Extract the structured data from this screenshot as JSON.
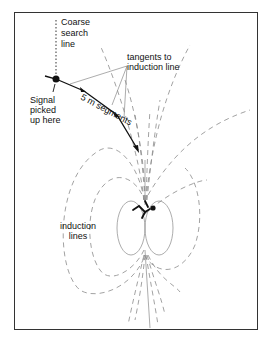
{
  "diagram": {
    "labels": {
      "search_line": [
        "Coarse",
        "search",
        "line"
      ],
      "tangents": [
        "tangents to",
        "induction line"
      ],
      "signal": [
        "Signal",
        "picked",
        "up here"
      ],
      "segments": "5 m segments",
      "induction": [
        "induction",
        "lines"
      ]
    },
    "colors": {
      "ink": "#111111",
      "field_lines": "#8a8a8a",
      "frame": "#333333"
    }
  }
}
